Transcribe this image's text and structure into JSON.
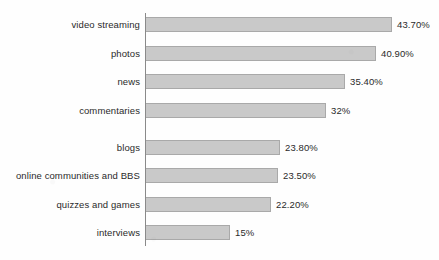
{
  "chart_data": {
    "type": "bar",
    "orientation": "horizontal",
    "title": "",
    "subtitle": "",
    "xlabel": "",
    "ylabel": "",
    "grid": false,
    "legend": null,
    "xlim": [
      0,
      43.7
    ],
    "axis_origin_percent": 0,
    "categories": [
      "video streaming",
      "photos",
      "news",
      "commentaries",
      "blogs",
      "online communities and BBS",
      "quizzes and games",
      "interviews"
    ],
    "values": [
      43.7,
      40.9,
      35.4,
      32,
      23.8,
      23.5,
      22.2,
      15
    ],
    "value_labels": [
      "43.70%",
      "40.90%",
      "35.40%",
      "32%",
      "23.80%",
      "23.50%",
      "22.20%",
      "15%"
    ],
    "series": [
      {
        "name": "share of users",
        "values": [
          43.7,
          40.9,
          35.4,
          32,
          23.8,
          23.5,
          22.2,
          15
        ]
      }
    ],
    "colors": {
      "bar_fill": "#c9c9c9",
      "bar_border": "#a9a9a9",
      "axis": "#8a8a8a",
      "text": "#2a2a2a",
      "background": "#fefefe"
    }
  }
}
